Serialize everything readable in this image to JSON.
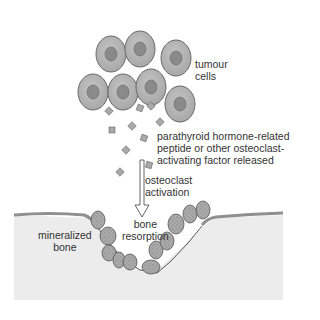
{
  "diagram": {
    "labels": {
      "tumour_cells": [
        "tumour",
        "cells"
      ],
      "factor": [
        "parathyroid hormone-related",
        "peptide or other osteoclast-",
        "activating factor released"
      ],
      "activation": [
        "osteoclast",
        "activation"
      ],
      "resorption": [
        "bone",
        "resorption"
      ],
      "bone": [
        "mineralized",
        "bone"
      ]
    },
    "colors": {
      "cell_fill": "#b3b3b3",
      "cell_stroke": "#6b6b6b",
      "nucleus": "#8a8a8a",
      "bone_fill": "#ececec",
      "bone_surface": "#8f8f8f",
      "osteoclast": "#a9a9a9"
    }
  }
}
